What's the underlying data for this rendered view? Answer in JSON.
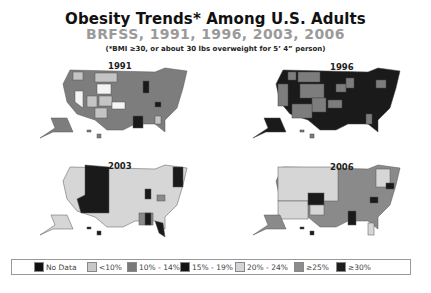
{
  "header": {
    "title": "Obesity Trends* Among U.S. Adults",
    "subtitle": "BRFSS, 1991, 1996, 2003, 2006",
    "footnote": "(*BMI ≥30, or about 30 lbs overweight for 5’ 4” person)"
  },
  "maps": [
    {
      "year": "1991",
      "dominant_category": "10%-14%"
    },
    {
      "year": "1996",
      "dominant_category": "15%-19%"
    },
    {
      "year": "2003",
      "dominant_category": "20%-24%"
    },
    {
      "year": "2006",
      "dominant_category": "20%-24% / ≥25%"
    }
  ],
  "legend": {
    "items": [
      {
        "label": "No Data",
        "color": "#111111"
      },
      {
        "label": "<10%",
        "color": "#c8c8c8"
      },
      {
        "label": "10% - 14%",
        "color": "#7a7a7a"
      },
      {
        "label": "15% - 19%",
        "color": "#141414"
      },
      {
        "label": "20% - 24%",
        "color": "#d4d4d4"
      },
      {
        "label": "≥25%",
        "color": "#8c8c8c"
      },
      {
        "label": "≥30%",
        "color": "#1e1e1e"
      }
    ]
  },
  "colors": {
    "lt10": "#f4f4f4",
    "light": "#c4c4c4",
    "mid": "#7d7d7d",
    "dark": "#1a1a1a",
    "lighter": "#d6d6d6",
    "gray25": "#8a8a8a"
  }
}
